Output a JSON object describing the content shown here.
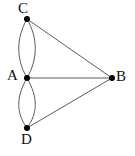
{
  "figure": {
    "kind": "undirected-multigraph-drawing",
    "background_color": "#ffffff",
    "edge_color": "#4a4a4a",
    "vertex_color": "#000000",
    "label_color": "#111111",
    "width": 135,
    "height": 156
  },
  "graph_data": {
    "type": "graph",
    "vertices": [
      {
        "id": "A",
        "label": "A",
        "x": 27,
        "y": 78,
        "label_x": 7,
        "label_y": 68
      },
      {
        "id": "B",
        "label": "B",
        "x": 112,
        "y": 78,
        "label_x": 116,
        "label_y": 69
      },
      {
        "id": "C",
        "label": "C",
        "x": 27,
        "y": 19,
        "label_x": 18,
        "label_y": 1
      },
      {
        "id": "D",
        "label": "D",
        "x": 27,
        "y": 128,
        "label_x": 21,
        "label_y": 132
      }
    ],
    "edges": [
      {
        "from": "C",
        "to": "A",
        "style": "curve-left",
        "multiplicity_index": 1
      },
      {
        "from": "C",
        "to": "A",
        "style": "curve-right",
        "multiplicity_index": 2
      },
      {
        "from": "A",
        "to": "D",
        "style": "curve-left",
        "multiplicity_index": 1
      },
      {
        "from": "A",
        "to": "D",
        "style": "curve-right",
        "multiplicity_index": 2
      },
      {
        "from": "A",
        "to": "B",
        "style": "straight",
        "multiplicity_index": 1
      },
      {
        "from": "C",
        "to": "B",
        "style": "straight",
        "multiplicity_index": 1
      },
      {
        "from": "D",
        "to": "B",
        "style": "straight",
        "multiplicity_index": 1
      }
    ],
    "edge_count": 7,
    "vertex_count": 4,
    "degrees": {
      "A": 5,
      "B": 3,
      "C": 3,
      "D": 3
    }
  },
  "labels": {
    "A": "A",
    "B": "B",
    "C": "C",
    "D": "D"
  }
}
